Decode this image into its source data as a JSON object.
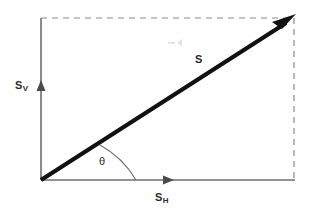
{
  "diagram": {
    "type": "vector-diagram",
    "background_color": "#fefefe",
    "axis_color": "#6f6f6f",
    "vector_color": "#111111",
    "dashed_color": "#8a8a8a",
    "text_color": "#2b2b2b",
    "origin": {
      "x": 41,
      "y": 180
    },
    "tip": {
      "x": 294,
      "y": 18
    },
    "labels": {
      "vertical_component": {
        "base": "S",
        "sub": "V"
      },
      "horizontal_component": {
        "base": "S",
        "sub": "H"
      },
      "resultant": {
        "base": "S",
        "sub": ""
      },
      "angle": {
        "base": "θ",
        "sub": ""
      }
    },
    "elements": {
      "vertical_axis_name": "vertical-axis",
      "horizontal_axis_name": "horizontal-axis",
      "resultant_vector_name": "resultant-vector",
      "angle_arc_name": "angle-arc",
      "dashed_top_name": "dashed-top-guide",
      "dashed_right_name": "dashed-right-guide"
    }
  }
}
